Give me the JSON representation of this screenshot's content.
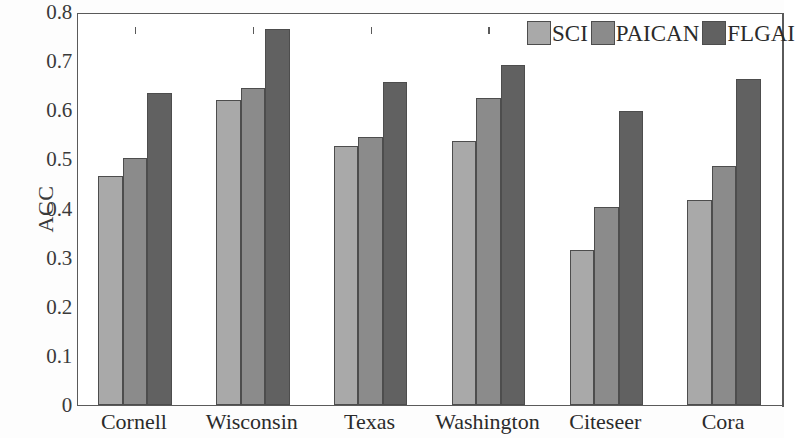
{
  "chart_data": {
    "type": "bar",
    "title": "",
    "xlabel": "",
    "ylabel": "ACC",
    "ylim": [
      0,
      0.8
    ],
    "ytick_labels": [
      "0.8",
      "0.7",
      "0.6",
      "0.5",
      "0.4",
      "0.3",
      "0.2",
      "0.1",
      "0"
    ],
    "ytick_values": [
      0.8,
      0.7,
      0.6,
      0.5,
      0.4,
      0.3,
      0.2,
      0.1,
      0
    ],
    "grid": false,
    "legend_position": "top-right",
    "categories": [
      "Cornell",
      "Wisconsin",
      "Texas",
      "Washington",
      "Citeseer",
      "Cora"
    ],
    "series": [
      {
        "name": "SCI",
        "color": "#a9a9a9",
        "values": [
          0.467,
          0.621,
          0.528,
          0.537,
          0.315,
          0.417
        ]
      },
      {
        "name": "PAICAN",
        "color": "#8b8b8b",
        "values": [
          0.502,
          0.646,
          0.546,
          0.625,
          0.403,
          0.487
        ]
      },
      {
        "name": "FLGAI",
        "color": "#616161",
        "values": [
          0.636,
          0.766,
          0.657,
          0.693,
          0.599,
          0.664
        ]
      }
    ]
  }
}
